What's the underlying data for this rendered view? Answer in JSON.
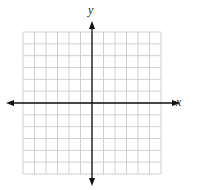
{
  "diagram": {
    "type": "coordinate-plane",
    "grid": {
      "columns": 12,
      "rows": 12,
      "left": 23,
      "top": 32,
      "right": 161,
      "bottom": 174,
      "color": "#cfcfcf"
    },
    "axes": {
      "color": "#111111",
      "x_axis_y": 103,
      "y_axis_x": 92,
      "x_label": "x",
      "y_label": "y"
    }
  }
}
